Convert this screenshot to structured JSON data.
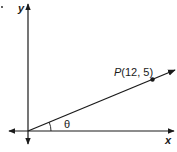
{
  "diagram": {
    "axes": {
      "x_label": "x",
      "y_label": "y"
    },
    "point": {
      "name": "P",
      "coords_text": "(12, 5)",
      "x": 12,
      "y": 5
    },
    "angle_label": "θ",
    "colors": {
      "stroke": "#1a1a1a",
      "background": "#ffffff"
    }
  }
}
